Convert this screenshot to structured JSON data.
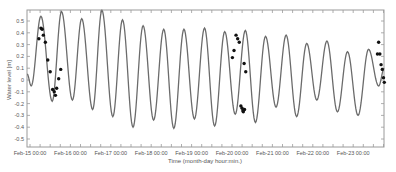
{
  "chart_data": {
    "type": "line",
    "title": "",
    "xlabel": "Time (month-day hour:min.)",
    "ylabel": "Water level [m]",
    "ylim": [
      -0.55,
      0.6
    ],
    "yticks": [
      0.5,
      0.4,
      0.3,
      0.2,
      0.1,
      0,
      -0.1,
      -0.2,
      -0.3,
      -0.4,
      -0.5
    ],
    "ytick_labels": [
      "0.5",
      "0.4",
      "0.3",
      "0.2",
      "0.1",
      "0",
      "-0.1",
      "-0.2",
      "-0.3",
      "-0.4",
      "-0.5"
    ],
    "xtick_labels": [
      "Feb-15 00:00",
      "Feb-16 00:00",
      "Feb-17 00:00",
      "Feb-18 00:00",
      "Feb-19 00:00",
      "Feb-20 00:00",
      "Feb-21 00:00",
      "Feb-22 00:00",
      "Feb-23 00:00"
    ],
    "xlim_days": [
      -0.07,
      8.77
    ],
    "grid": false,
    "legend": null,
    "series": [
      {
        "name": "Modelled water level",
        "style": "line",
        "color": "#555555",
        "extrema_days": [
          -0.07,
          0.03,
          0.27,
          0.55,
          0.78,
          1.05,
          1.28,
          1.55,
          1.78,
          2.05,
          2.29,
          2.55,
          2.8,
          3.06,
          3.31,
          3.56,
          3.81,
          4.07,
          4.32,
          4.57,
          4.82,
          5.08,
          5.33,
          5.58,
          5.83,
          6.09,
          6.34,
          6.6,
          6.85,
          7.1,
          7.35,
          7.61,
          7.86,
          8.12,
          8.38,
          8.63,
          8.77
        ],
        "extrema_values": [
          0.05,
          -0.05,
          0.54,
          -0.18,
          0.58,
          -0.17,
          0.52,
          -0.25,
          0.59,
          -0.31,
          0.51,
          -0.4,
          0.46,
          -0.34,
          0.43,
          -0.41,
          0.43,
          -0.33,
          0.44,
          -0.39,
          0.41,
          -0.29,
          0.42,
          -0.36,
          0.37,
          -0.23,
          0.38,
          -0.31,
          0.31,
          -0.17,
          0.33,
          -0.27,
          0.24,
          -0.3,
          0.26,
          -0.05,
          0.1
        ]
      },
      {
        "name": "Observed water level",
        "style": "scatter",
        "color": "#111111",
        "points": [
          {
            "day": 0.22,
            "value": 0.35
          },
          {
            "day": 0.27,
            "value": 0.44
          },
          {
            "day": 0.3,
            "value": 0.43
          },
          {
            "day": 0.33,
            "value": 0.38
          },
          {
            "day": 0.38,
            "value": 0.32
          },
          {
            "day": 0.44,
            "value": 0.17
          },
          {
            "day": 0.5,
            "value": 0.07
          },
          {
            "day": 0.56,
            "value": -0.08
          },
          {
            "day": 0.6,
            "value": -0.1
          },
          {
            "day": 0.63,
            "value": -0.13
          },
          {
            "day": 0.66,
            "value": -0.07
          },
          {
            "day": 0.71,
            "value": 0.01
          },
          {
            "day": 0.76,
            "value": 0.09
          },
          {
            "day": 5.01,
            "value": 0.19
          },
          {
            "day": 5.05,
            "value": 0.25
          },
          {
            "day": 5.1,
            "value": 0.38
          },
          {
            "day": 5.14,
            "value": 0.35
          },
          {
            "day": 5.18,
            "value": 0.32
          },
          {
            "day": 5.3,
            "value": 0.14
          },
          {
            "day": 5.34,
            "value": 0.07
          },
          {
            "day": 5.22,
            "value": -0.22
          },
          {
            "day": 5.25,
            "value": -0.24
          },
          {
            "day": 5.28,
            "value": -0.27
          },
          {
            "day": 5.31,
            "value": -0.25
          },
          {
            "day": 5.27,
            "value": -0.26
          },
          {
            "day": 8.63,
            "value": 0.32
          },
          {
            "day": 8.66,
            "value": 0.22
          },
          {
            "day": 8.6,
            "value": 0.22
          },
          {
            "day": 8.69,
            "value": 0.13
          },
          {
            "day": 8.72,
            "value": 0.09
          },
          {
            "day": 8.75,
            "value": 0.02
          },
          {
            "day": 8.77,
            "value": -0.02
          }
        ]
      }
    ]
  }
}
